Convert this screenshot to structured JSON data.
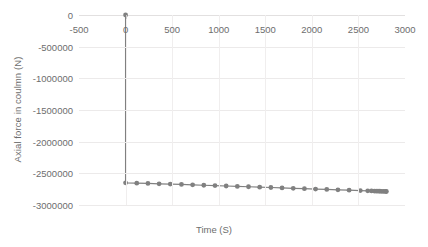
{
  "chart_data": {
    "type": "line",
    "title": "",
    "xlabel": "Time (S)",
    "ylabel": "Axial force in coulmn (N)",
    "xlim": [
      -500,
      3000
    ],
    "ylim": [
      -3000000,
      0
    ],
    "xticks": [
      -500,
      0,
      500,
      1000,
      1500,
      2000,
      2500,
      3000
    ],
    "xtick_labels": [
      "-500",
      "0",
      "500",
      "1000",
      "1500",
      "2000",
      "2500",
      "3000"
    ],
    "yticks": [
      0,
      -500000,
      -1000000,
      -1500000,
      -2000000,
      -2500000,
      -3000000
    ],
    "ytick_labels": [
      "0",
      "-500000",
      "-1000000",
      "-1500000",
      "-2000000",
      "-2500000",
      "-3000000"
    ],
    "grid": true,
    "legend": false,
    "legend_position": "none",
    "series": [
      {
        "name": "Axial force in coulmn (N)",
        "color": "#808080",
        "marker": "circle",
        "x": [
          0,
          0,
          120,
          240,
          360,
          480,
          600,
          720,
          840,
          960,
          1080,
          1200,
          1320,
          1440,
          1560,
          1680,
          1800,
          1920,
          2040,
          2160,
          2280,
          2400,
          2520,
          2600,
          2640,
          2670,
          2690,
          2710,
          2730,
          2750,
          2770,
          2790,
          2800
        ],
        "y": [
          0,
          -2650000,
          -2655000,
          -2660000,
          -2665000,
          -2670000,
          -2675000,
          -2682000,
          -2688000,
          -2694000,
          -2700000,
          -2706000,
          -2712000,
          -2718000,
          -2724000,
          -2730000,
          -2736000,
          -2742000,
          -2748000,
          -2754000,
          -2760000,
          -2766000,
          -2772000,
          -2776000,
          -2778000,
          -2780000,
          -2781000,
          -2782000,
          -2783000,
          -2784000,
          -2785000,
          -2786000,
          -2787000
        ]
      }
    ]
  },
  "style": {
    "line_color": "#808080",
    "marker_color": "#808080",
    "grid_color": "#ECEAEA",
    "text_color": "#6D6D6D",
    "background": "#FFFFFF"
  }
}
